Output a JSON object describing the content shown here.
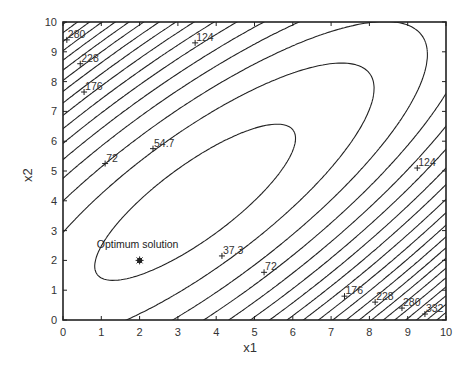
{
  "chart_data": {
    "type": "contour",
    "title": "",
    "xlabel": "x1",
    "ylabel": "x2",
    "xlim": [
      0,
      10
    ],
    "ylim": [
      0,
      10
    ],
    "xticks": [
      0,
      1,
      2,
      3,
      4,
      5,
      6,
      7,
      8,
      9,
      10
    ],
    "yticks": [
      0,
      1,
      2,
      3,
      4,
      5,
      6,
      7,
      8,
      9,
      10
    ],
    "grid": false,
    "legend": null,
    "line_color": "#222222",
    "contour_levels": [
      37.3,
      54.7,
      72.1,
      89.5,
      106.9,
      124.3,
      141.7,
      159.1,
      176.5,
      193.9,
      211.3,
      228.7,
      246.1,
      263.5,
      280.9,
      298.3,
      315.7,
      333.1,
      350.5,
      367.9,
      385.3,
      402.7,
      420.1,
      437.5
    ],
    "approx_function": {
      "f0": 29.3,
      "a": 3.2,
      "d0": -0.5,
      "b": 0.32,
      "s0": 7.4,
      "note": "f = f0 + a*((x1-x2)-d0)^2 + b*((x1+x2)-s0)^2"
    },
    "contour_labels": [
      {
        "text": "280",
        "x": 0.1,
        "y": 9.4
      },
      {
        "text": "228",
        "x": 0.45,
        "y": 8.6
      },
      {
        "text": "176",
        "x": 0.55,
        "y": 7.65
      },
      {
        "text": "124",
        "x": 3.45,
        "y": 9.3
      },
      {
        "text": "54.7",
        "x": 2.35,
        "y": 5.75
      },
      {
        "text": "72",
        "x": 1.1,
        "y": 5.25
      },
      {
        "text": "37.3",
        "x": 4.15,
        "y": 2.15
      },
      {
        "text": "72",
        "x": 5.25,
        "y": 1.6
      },
      {
        "text": "124",
        "x": 9.25,
        "y": 5.1
      },
      {
        "text": "176",
        "x": 7.35,
        "y": 0.8
      },
      {
        "text": "228",
        "x": 8.15,
        "y": 0.6
      },
      {
        "text": "280",
        "x": 8.85,
        "y": 0.4
      },
      {
        "text": "332",
        "x": 9.45,
        "y": 0.2
      }
    ],
    "annotations": [
      {
        "text": "Optimum solution",
        "x": 2.0,
        "y": 2.0,
        "marker": "asterisk"
      }
    ]
  }
}
